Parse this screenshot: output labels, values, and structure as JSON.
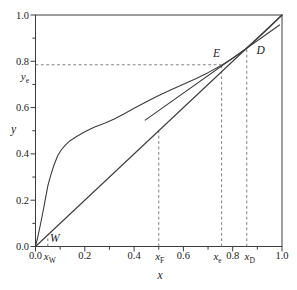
{
  "chart_data": {
    "type": "line",
    "title": "",
    "xlabel": "x",
    "ylabel": "y",
    "xlim": [
      0,
      1
    ],
    "ylim": [
      0,
      1
    ],
    "grid": false,
    "legend": null,
    "x_ticks": [
      {
        "label": "0.0",
        "value": 0.0
      },
      {
        "label": "0.2",
        "value": 0.2
      },
      {
        "label": "0.4",
        "value": 0.4
      },
      {
        "label": "0.6",
        "value": 0.6
      },
      {
        "label": "0.8",
        "value": 0.8
      },
      {
        "label": "1.0",
        "value": 1.0
      }
    ],
    "y_ticks": [
      {
        "label": "0.0",
        "value": 0.0
      },
      {
        "label": "0.2",
        "value": 0.2
      },
      {
        "label": "0.4",
        "value": 0.4
      },
      {
        "label": "0.6",
        "value": 0.6
      },
      {
        "label": "0.8",
        "value": 0.8
      },
      {
        "label": "1.0",
        "value": 1.0
      }
    ],
    "minor_tick_values": [
      0.1,
      0.3,
      0.5,
      0.7,
      0.9
    ],
    "series": [
      {
        "name": "equilibrium-curve",
        "points": [
          [
            0,
            0
          ],
          [
            0.01,
            0.045
          ],
          [
            0.02,
            0.095
          ],
          [
            0.03,
            0.148
          ],
          [
            0.04,
            0.205
          ],
          [
            0.05,
            0.262
          ],
          [
            0.062,
            0.308
          ],
          [
            0.075,
            0.352
          ],
          [
            0.09,
            0.392
          ],
          [
            0.105,
            0.418
          ],
          [
            0.12,
            0.437
          ],
          [
            0.14,
            0.457
          ],
          [
            0.17,
            0.477
          ],
          [
            0.2,
            0.496
          ],
          [
            0.24,
            0.516
          ],
          [
            0.28,
            0.532
          ],
          [
            0.32,
            0.551
          ],
          [
            0.36,
            0.573
          ],
          [
            0.4,
            0.597
          ],
          [
            0.45,
            0.625
          ],
          [
            0.5,
            0.652
          ],
          [
            0.55,
            0.677
          ],
          [
            0.6,
            0.701
          ],
          [
            0.65,
            0.725
          ],
          [
            0.7,
            0.751
          ],
          [
            0.755,
            0.783
          ],
          [
            0.8,
            0.813
          ],
          [
            0.85,
            0.851
          ],
          [
            0.9,
            0.898
          ],
          [
            0.95,
            0.948
          ],
          [
            1,
            1
          ]
        ]
      },
      {
        "name": "diagonal",
        "points": [
          [
            0,
            0
          ],
          [
            1,
            1
          ]
        ]
      },
      {
        "name": "operating-line",
        "points": [
          [
            0.445,
            0.546
          ],
          [
            0.99,
            0.957
          ]
        ]
      }
    ],
    "guides": [
      {
        "name": "y_e-horizontal",
        "type": "h",
        "y": 0.785,
        "x1": 0,
        "x2": 0.755
      },
      {
        "name": "x_e-vertical",
        "type": "v",
        "x": 0.755,
        "y1": 0,
        "y2": 0.785
      },
      {
        "name": "x_D-vertical",
        "type": "v",
        "x": 0.857,
        "y1": 0,
        "y2": 0.857
      },
      {
        "name": "x_F-vertical",
        "type": "v",
        "x": 0.5,
        "y1": 0,
        "y2": 0.5
      },
      {
        "name": "x_W-vertical",
        "type": "v",
        "x": 0.05,
        "y1": 0,
        "y2": 0.05
      }
    ],
    "special_x_labels": [
      {
        "base": "x",
        "sub": "W",
        "value": 0.05,
        "dx": 2
      },
      {
        "base": "x",
        "sub": "F",
        "value": 0.5,
        "dx": 1
      },
      {
        "base": "x",
        "sub": "e",
        "value": 0.755,
        "dx": -4
      },
      {
        "base": "x",
        "sub": "D",
        "value": 0.857,
        "dx": 3
      }
    ],
    "special_y_labels": [
      {
        "base": "y",
        "sub": "e",
        "value": 0.785
      }
    ],
    "point_labels": [
      {
        "label": "W",
        "x": 0.05,
        "y": 0.05,
        "dx": 7,
        "dy": 3
      },
      {
        "label": "E",
        "x": 0.755,
        "y": 0.785,
        "dx": -5,
        "dy": -12
      },
      {
        "label": "D",
        "x": 0.857,
        "y": 0.857,
        "dx": 14,
        "dy": 2
      }
    ],
    "colors": {
      "line": "#3c3c3c",
      "dashed": "#707070",
      "text": "#1b1b1b",
      "background": "#ffffff"
    }
  }
}
